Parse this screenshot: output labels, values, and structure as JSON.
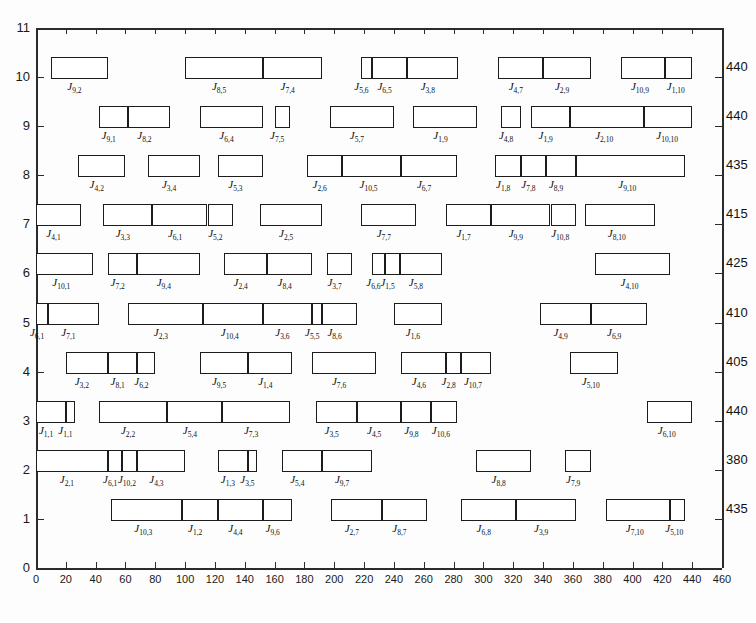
{
  "chart_data": {
    "type": "bar",
    "title": "",
    "xlabel": "",
    "ylabel": "",
    "orientation": "horizontal",
    "grid": false,
    "legend": null,
    "xlim": [
      0,
      460
    ],
    "ylim": [
      0,
      11
    ],
    "xticks": [
      0,
      20,
      40,
      60,
      80,
      100,
      120,
      140,
      160,
      180,
      200,
      220,
      240,
      260,
      280,
      300,
      320,
      340,
      360,
      380,
      400,
      420,
      440,
      460
    ],
    "yticks": [
      0,
      1,
      2,
      3,
      4,
      5,
      6,
      7,
      8,
      9,
      10,
      11
    ],
    "machine_end_times": {
      "10": 440,
      "9": 440,
      "8": 435,
      "7": 415,
      "6": 425,
      "5": 410,
      "4": 405,
      "3": 440,
      "2": 380,
      "1": 435
    },
    "rows": [
      {
        "machine": 10,
        "end_label": "440",
        "tasks": [
          {
            "label": "J",
            "sub": "9,2",
            "start": 10,
            "end": 48
          },
          {
            "label": "J",
            "sub": "8,5",
            "start": 100,
            "end": 152
          },
          {
            "label": "J",
            "sub": "7,4",
            "start": 152,
            "end": 192
          },
          {
            "label": "J",
            "sub": "5,6",
            "start": 218,
            "end": 225
          },
          {
            "label": "J",
            "sub": "6,5",
            "start": 225,
            "end": 249
          },
          {
            "label": "J",
            "sub": "3,8",
            "start": 249,
            "end": 283
          },
          {
            "label": "J",
            "sub": "4,7",
            "start": 310,
            "end": 340
          },
          {
            "label": "J",
            "sub": "2,9",
            "start": 340,
            "end": 372
          },
          {
            "label": "J",
            "sub": "10,9",
            "start": 392,
            "end": 422
          },
          {
            "label": "J",
            "sub": "1,10",
            "start": 422,
            "end": 440
          }
        ]
      },
      {
        "machine": 9,
        "end_label": "440",
        "tasks": [
          {
            "label": "J",
            "sub": "9,1",
            "start": 42,
            "end": 62
          },
          {
            "label": "J",
            "sub": "8,2",
            "start": 62,
            "end": 90
          },
          {
            "label": "J",
            "sub": "6,4",
            "start": 110,
            "end": 152
          },
          {
            "label": "J",
            "sub": "7,5",
            "start": 160,
            "end": 170
          },
          {
            "label": "J",
            "sub": "5,7",
            "start": 197,
            "end": 240
          },
          {
            "label": "J",
            "sub": "1,9",
            "start": 253,
            "end": 296
          },
          {
            "label": "J",
            "sub": "4,8",
            "start": 312,
            "end": 325
          },
          {
            "label": "J",
            "sub": "1,9b",
            "start": 332,
            "end": 358
          },
          {
            "label": "J",
            "sub": "2,10",
            "start": 358,
            "end": 408
          },
          {
            "label": "J",
            "sub": "10,10",
            "start": 408,
            "end": 440
          }
        ]
      },
      {
        "machine": 8,
        "end_label": "435",
        "tasks": [
          {
            "label": "J",
            "sub": "4,2",
            "start": 28,
            "end": 60
          },
          {
            "label": "J",
            "sub": "3,4",
            "start": 75,
            "end": 110
          },
          {
            "label": "J",
            "sub": "5,3",
            "start": 122,
            "end": 152
          },
          {
            "label": "J",
            "sub": "2,6",
            "start": 182,
            "end": 205
          },
          {
            "label": "J",
            "sub": "10,5",
            "start": 205,
            "end": 245
          },
          {
            "label": "J",
            "sub": "6,7",
            "start": 245,
            "end": 282
          },
          {
            "label": "J",
            "sub": "1,8",
            "start": 308,
            "end": 325
          },
          {
            "label": "J",
            "sub": "7,8",
            "start": 325,
            "end": 342
          },
          {
            "label": "J",
            "sub": "8,9",
            "start": 342,
            "end": 362
          },
          {
            "label": "J",
            "sub": "9,10",
            "start": 362,
            "end": 435
          }
        ]
      },
      {
        "machine": 7,
        "end_label": "415",
        "tasks": [
          {
            "label": "J",
            "sub": "4,1",
            "start": 0,
            "end": 30
          },
          {
            "label": "J",
            "sub": "3,3",
            "start": 45,
            "end": 78
          },
          {
            "label": "J",
            "sub": "6,1",
            "start": 78,
            "end": 115
          },
          {
            "label": "J",
            "sub": "5,2",
            "start": 115,
            "end": 132
          },
          {
            "label": "J",
            "sub": "2,5",
            "start": 150,
            "end": 192
          },
          {
            "label": "J",
            "sub": "7,7",
            "start": 218,
            "end": 255
          },
          {
            "label": "J",
            "sub": "1,7",
            "start": 275,
            "end": 305
          },
          {
            "label": "J",
            "sub": "9,9",
            "start": 305,
            "end": 345
          },
          {
            "label": "J",
            "sub": "10,8",
            "start": 345,
            "end": 362
          },
          {
            "label": "J",
            "sub": "8,10",
            "start": 368,
            "end": 415
          }
        ]
      },
      {
        "machine": 6,
        "end_label": "425",
        "tasks": [
          {
            "label": "J",
            "sub": "10,1",
            "start": 0,
            "end": 38
          },
          {
            "label": "J",
            "sub": "7,2",
            "start": 48,
            "end": 68
          },
          {
            "label": "J",
            "sub": "9,4",
            "start": 68,
            "end": 110
          },
          {
            "label": "J",
            "sub": "2,4",
            "start": 126,
            "end": 155
          },
          {
            "label": "J",
            "sub": "8,4",
            "start": 155,
            "end": 185
          },
          {
            "label": "J",
            "sub": "3,7",
            "start": 195,
            "end": 212
          },
          {
            "label": "J",
            "sub": "6,6",
            "start": 225,
            "end": 234
          },
          {
            "label": "J",
            "sub": "1,5",
            "start": 234,
            "end": 244
          },
          {
            "label": "J",
            "sub": "5,8",
            "start": 244,
            "end": 272
          },
          {
            "label": "J",
            "sub": "4,10",
            "start": 375,
            "end": 425
          }
        ]
      },
      {
        "machine": 5,
        "end_label": "410",
        "tasks": [
          {
            "label": "J",
            "sub": "6,1",
            "start": 0,
            "end": 8
          },
          {
            "label": "J",
            "sub": "7,1",
            "start": 8,
            "end": 42
          },
          {
            "label": "J",
            "sub": "2,3",
            "start": 62,
            "end": 112
          },
          {
            "label": "J",
            "sub": "10,4",
            "start": 112,
            "end": 152
          },
          {
            "label": "J",
            "sub": "3,6",
            "start": 152,
            "end": 185
          },
          {
            "label": "J",
            "sub": "5,5",
            "start": 185,
            "end": 192
          },
          {
            "label": "J",
            "sub": "8,6",
            "start": 192,
            "end": 215
          },
          {
            "label": "J",
            "sub": "1,6",
            "start": 240,
            "end": 272
          },
          {
            "label": "J",
            "sub": "4,9",
            "start": 338,
            "end": 372
          },
          {
            "label": "J",
            "sub": "6,9",
            "start": 372,
            "end": 410
          }
        ]
      },
      {
        "machine": 4,
        "end_label": "405",
        "tasks": [
          {
            "label": "J",
            "sub": "3,2",
            "start": 20,
            "end": 48
          },
          {
            "label": "J",
            "sub": "8,1",
            "start": 48,
            "end": 68
          },
          {
            "label": "J",
            "sub": "6,2",
            "start": 68,
            "end": 80
          },
          {
            "label": "J",
            "sub": "9,5",
            "start": 110,
            "end": 142
          },
          {
            "label": "J",
            "sub": "1,4",
            "start": 142,
            "end": 172
          },
          {
            "label": "J",
            "sub": "7,6",
            "start": 185,
            "end": 228
          },
          {
            "label": "J",
            "sub": "4,6",
            "start": 245,
            "end": 275
          },
          {
            "label": "J",
            "sub": "2,8",
            "start": 275,
            "end": 285
          },
          {
            "label": "J",
            "sub": "10,7",
            "start": 285,
            "end": 305
          },
          {
            "label": "J",
            "sub": "5,10",
            "start": 358,
            "end": 390
          }
        ]
      },
      {
        "machine": 3,
        "end_label": "440",
        "tasks": [
          {
            "label": "J",
            "sub": "1,1",
            "start": 0,
            "end": 20
          },
          {
            "label": "J",
            "sub": "1,1b",
            "start": 20,
            "end": 26
          },
          {
            "label": "J",
            "sub": "2,2",
            "start": 42,
            "end": 88
          },
          {
            "label": "J",
            "sub": "5,4",
            "start": 88,
            "end": 125
          },
          {
            "label": "J",
            "sub": "7,3",
            "start": 125,
            "end": 170
          },
          {
            "label": "J",
            "sub": "3,5",
            "start": 188,
            "end": 215
          },
          {
            "label": "J",
            "sub": "4,5",
            "start": 215,
            "end": 245
          },
          {
            "label": "J",
            "sub": "9,8",
            "start": 245,
            "end": 265
          },
          {
            "label": "J",
            "sub": "10,6",
            "start": 265,
            "end": 282
          },
          {
            "label": "J",
            "sub": "6,10",
            "start": 410,
            "end": 440
          }
        ]
      },
      {
        "machine": 2,
        "end_label": "380",
        "tasks": [
          {
            "label": "J",
            "sub": "2,1",
            "start": 0,
            "end": 48
          },
          {
            "label": "J",
            "sub": "6,1",
            "start": 48,
            "end": 58
          },
          {
            "label": "J",
            "sub": "10,2",
            "start": 58,
            "end": 68
          },
          {
            "label": "J",
            "sub": "4,3",
            "start": 68,
            "end": 100
          },
          {
            "label": "J",
            "sub": "1,3",
            "start": 122,
            "end": 142
          },
          {
            "label": "J",
            "sub": "3,5",
            "start": 142,
            "end": 148
          },
          {
            "label": "J",
            "sub": "5,4",
            "start": 165,
            "end": 192
          },
          {
            "label": "J",
            "sub": "9,7",
            "start": 192,
            "end": 225
          },
          {
            "label": "J",
            "sub": "8,8",
            "start": 295,
            "end": 332
          },
          {
            "label": "J",
            "sub": "7,9",
            "start": 355,
            "end": 372
          }
        ]
      },
      {
        "machine": 1,
        "end_label": "435",
        "tasks": [
          {
            "label": "J",
            "sub": "10,3",
            "start": 50,
            "end": 98
          },
          {
            "label": "J",
            "sub": "1,2",
            "start": 98,
            "end": 122
          },
          {
            "label": "J",
            "sub": "4,4",
            "start": 122,
            "end": 152
          },
          {
            "label": "J",
            "sub": "9,6",
            "start": 152,
            "end": 172
          },
          {
            "label": "J",
            "sub": "2,7",
            "start": 198,
            "end": 232
          },
          {
            "label": "J",
            "sub": "8,7",
            "start": 232,
            "end": 262
          },
          {
            "label": "J",
            "sub": "6,8",
            "start": 285,
            "end": 322
          },
          {
            "label": "J",
            "sub": "3,9",
            "start": 322,
            "end": 362
          },
          {
            "label": "J",
            "sub": "7,10",
            "start": 382,
            "end": 425
          },
          {
            "label": "J",
            "sub": "5,10",
            "start": 425,
            "end": 435
          }
        ]
      }
    ]
  }
}
